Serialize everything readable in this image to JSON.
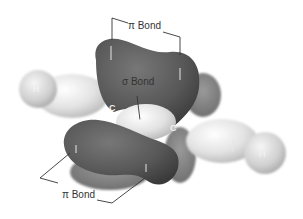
{
  "diagram": {
    "labels": {
      "pi_bond_top": "π Bond",
      "pi_bond_bottom": "π Bond",
      "sigma_bond": "σ Bond"
    },
    "atoms": {
      "carbon_left": "C",
      "carbon_right": "C",
      "hydrogen_left": "H",
      "hydrogen_right": "H",
      "hydrogen_center": "H"
    },
    "colors": {
      "pi_lobe": "#5a5a5a",
      "pi_lobe_shadow": "#3e3e3e",
      "sigma_lobe": "#e8e8e8",
      "hydrogen_sphere": "#d8d8d8",
      "background": "#ffffff",
      "leader_line": "#333333"
    }
  }
}
